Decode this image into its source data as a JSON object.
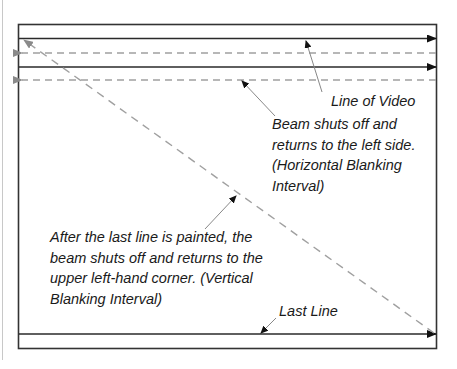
{
  "diagram": {
    "type": "raster-scan",
    "colors": {
      "frame": "#333333",
      "scan_line": "#2a2a2a",
      "retrace_dashed": "#a0a0a0",
      "pointer": "#888888",
      "text": "#1a1a1a",
      "page_margin_line": "#c8c8c8"
    },
    "labels": {
      "line_of_video": "Line of Video",
      "horizontal_blanking": [
        "Beam shuts off and",
        "returns to the left side.",
        "(Horizontal Blanking",
        "Interval)"
      ],
      "vertical_blanking": [
        "After the last line is painted, the",
        "beam shuts off and returns to the",
        "upper left-hand corner. (Vertical",
        "Blanking Interval)"
      ],
      "last_line": "Last Line"
    }
  }
}
